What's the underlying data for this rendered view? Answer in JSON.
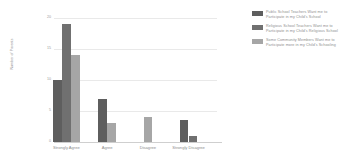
{
  "chart_data": {
    "type": "bar",
    "title": "",
    "xlabel": "",
    "ylabel": "Number of Parents",
    "ylim": [
      0,
      20
    ],
    "yticks": [
      0,
      5,
      10,
      15,
      20
    ],
    "grid": true,
    "legend_position": "right",
    "categories": [
      "Strongly Agree",
      "Agree",
      "Disagree",
      "Strongly Disagree"
    ],
    "series": [
      {
        "name": "Public School Teachers Want me to Participate in my Child's School",
        "color": "#5e5e5e",
        "values": [
          10,
          7,
          0,
          3.5
        ]
      },
      {
        "name": "Religious School Teachers Want me to Participate in my Child's Religious School",
        "color": "#707070",
        "values": [
          19,
          0,
          0,
          1
        ]
      },
      {
        "name": "Some Community Members Want me to Participate more in my Child's Schooling",
        "color": "#a6a6a6",
        "values": [
          14,
          3,
          4,
          0
        ]
      }
    ]
  }
}
